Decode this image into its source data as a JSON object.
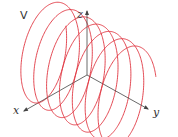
{
  "figure": {
    "panel_label": "V",
    "curve_color": "#e0343f",
    "axis_color": "#444444",
    "axes": {
      "x_label": "x",
      "y_label": "y",
      "z_label": "z"
    },
    "helix": {
      "axis": "y",
      "turns": 7
    }
  }
}
